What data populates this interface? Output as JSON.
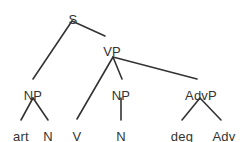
{
  "diagram": {
    "type": "syntax-tree",
    "background_color": "#ffffff",
    "line_color": "#333333",
    "text_color": "#333333",
    "nodes": [
      {
        "id": "S",
        "label": "S",
        "x": 73,
        "y": 13,
        "level": 0
      },
      {
        "id": "NP1",
        "label": "NP",
        "x": 33,
        "y": 89,
        "level": 2
      },
      {
        "id": "VP",
        "label": "VP",
        "x": 112,
        "y": 45,
        "level": 1
      },
      {
        "id": "art",
        "label": "art",
        "x": 21,
        "y": 130,
        "level": 3
      },
      {
        "id": "N1",
        "label": "N",
        "x": 48,
        "y": 130,
        "level": 3
      },
      {
        "id": "V",
        "label": "V",
        "x": 77,
        "y": 130,
        "level": 3
      },
      {
        "id": "NP2",
        "label": "NP",
        "x": 121,
        "y": 89,
        "level": 2
      },
      {
        "id": "N2",
        "label": "N",
        "x": 121,
        "y": 130,
        "level": 3
      },
      {
        "id": "AdvP",
        "label": "AdvP",
        "x": 201,
        "y": 89,
        "level": 2
      },
      {
        "id": "deg",
        "label": "deg",
        "x": 182,
        "y": 130,
        "level": 3
      },
      {
        "id": "Adv",
        "label": "Adv",
        "x": 224,
        "y": 130,
        "level": 3
      }
    ],
    "edges": [
      {
        "from": "S",
        "to": "NP1",
        "x1": 72,
        "y1": 21,
        "x2": 33,
        "y2": 79
      },
      {
        "from": "S",
        "to": "VP",
        "x1": 72,
        "y1": 21,
        "x2": 105,
        "y2": 36
      },
      {
        "from": "VP",
        "to": "V",
        "x1": 113,
        "y1": 57,
        "x2": 77,
        "y2": 119
      },
      {
        "from": "VP",
        "to": "NP2",
        "x1": 113,
        "y1": 57,
        "x2": 122,
        "y2": 79
      },
      {
        "from": "VP",
        "to": "AdvP",
        "x1": 113,
        "y1": 57,
        "x2": 197,
        "y2": 79
      },
      {
        "from": "NP1",
        "to": "art",
        "x1": 33,
        "y1": 98,
        "x2": 21,
        "y2": 120
      },
      {
        "from": "NP1",
        "to": "N1",
        "x1": 33,
        "y1": 98,
        "x2": 48,
        "y2": 120
      },
      {
        "from": "NP2",
        "to": "N2",
        "x1": 121,
        "y1": 98,
        "x2": 121,
        "y2": 120
      },
      {
        "from": "AdvP",
        "to": "deg",
        "x1": 200,
        "y1": 98,
        "x2": 182,
        "y2": 120
      },
      {
        "from": "AdvP",
        "to": "Adv",
        "x1": 200,
        "y1": 98,
        "x2": 221,
        "y2": 120
      }
    ]
  }
}
